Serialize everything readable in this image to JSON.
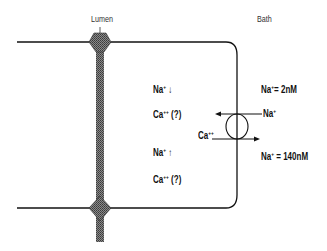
{
  "labels": {
    "lumen": "Lumen",
    "bath": "Bath"
  },
  "cell_interior": {
    "na_down": {
      "ion": "Na",
      "charge": "+",
      "symbol": "↓"
    },
    "ca_q1": {
      "ion": "Ca",
      "charge": "++",
      "symbol": "(?)"
    },
    "na_up": {
      "ion": "Na",
      "charge": "+",
      "symbol": "↑"
    },
    "ca_q2": {
      "ion": "Ca",
      "charge": "++",
      "symbol": "(?)"
    }
  },
  "bath_concentrations": {
    "na_low": {
      "ion": "Na",
      "charge": "+",
      "value": "= 2nM"
    },
    "na_high": {
      "ion": "Na",
      "charge": "+",
      "value": "= 140nM"
    }
  },
  "exchanger": {
    "na_in": {
      "ion": "Na",
      "charge": "+"
    },
    "ca_out": {
      "ion": "Ca",
      "charge": "++"
    }
  },
  "colors": {
    "line": "#111111",
    "junction": "#555555"
  }
}
